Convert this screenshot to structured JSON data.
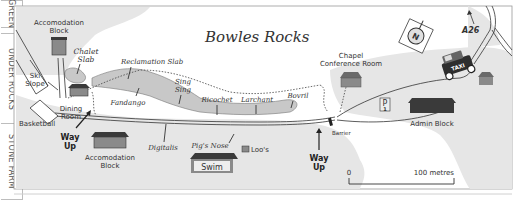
{
  "side_tabs": [
    {
      "label": "GREEN"
    },
    {
      "label": "UNDER ROCKS"
    },
    {
      "label": "STONE FARM"
    }
  ],
  "map": {
    "title": "Bowles Rocks",
    "colors": {
      "land": "#e6e6e6",
      "rock": "#c8c8c8",
      "building_roof": "#3a3a3a",
      "building_wall": "#8a8a8a",
      "line": "#333333"
    },
    "buildings": {
      "accom_top": {
        "line1": "Accomodation",
        "line2": "Block"
      },
      "dining": {
        "line1": "Dining",
        "line2": "Room"
      },
      "accom_bottom": {
        "line1": "Accomodation",
        "line2": "Block"
      },
      "swim": {
        "label": "Swim"
      },
      "loos": {
        "label": "Loo's"
      },
      "chapel": {
        "line1": "Chapel",
        "line2": "Conference Room"
      },
      "admin": {
        "label": "Admin Block"
      }
    },
    "areas": {
      "ski_slope": {
        "line1": "Ski",
        "line2": "Slope"
      },
      "basketball": {
        "label": "Basketball"
      },
      "parking": {
        "label": "P",
        "sub": "1"
      }
    },
    "crags": {
      "chalet_slab": {
        "line1": "Chalet",
        "line2": "Slab"
      },
      "reclamation_slab": {
        "label": "Reclamation Slab"
      },
      "fandango": {
        "label": "Fandango"
      },
      "sing_sing": {
        "line1": "Sing",
        "line2": "Sing"
      },
      "ricochet": {
        "label": "Ricochet"
      },
      "larchant": {
        "label": "Larchant"
      },
      "bovril": {
        "label": "Bovril"
      },
      "digitalis": {
        "label": "Digitalis"
      },
      "pigs_nose": {
        "label": "Pig's Nose"
      }
    },
    "way_up_left": {
      "line1": "Way",
      "line2": "Up"
    },
    "way_up_right": {
      "line1": "Way",
      "line2": "Up"
    },
    "barrier": {
      "label": "Barrier"
    },
    "road": {
      "label": "A26"
    },
    "taxi": {
      "label": "TAXI"
    },
    "compass": {
      "label": "N"
    },
    "scale": {
      "start": "0",
      "end": "100 metres"
    }
  }
}
